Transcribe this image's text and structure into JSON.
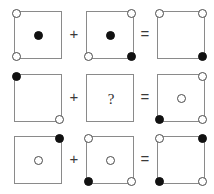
{
  "puzzle": {
    "title": "visual analogy dot puzzle",
    "operators": {
      "plus": "+",
      "equals": "=",
      "unknown": "?"
    },
    "colors": {
      "filled": "#111111",
      "open_fill": "#ffffff",
      "open_stroke": "#4a4a4a",
      "box_border": "#8a8a8a",
      "background": "#ffffff"
    },
    "slot_names": [
      "top-left",
      "top-right",
      "center",
      "bottom-left",
      "bottom-right"
    ],
    "rows": [
      {
        "index": 1,
        "operands": [
          {
            "name": "row1-operand-a",
            "dots": [
              {
                "slot": "top-left",
                "style": "open"
              },
              {
                "slot": "center",
                "style": "filled"
              },
              {
                "slot": "bottom-left",
                "style": "open"
              }
            ]
          },
          {
            "name": "row1-operand-b",
            "dots": [
              {
                "slot": "top-right",
                "style": "open"
              },
              {
                "slot": "center",
                "style": "filled"
              },
              {
                "slot": "bottom-left",
                "style": "open"
              },
              {
                "slot": "bottom-right",
                "style": "filled"
              }
            ]
          }
        ],
        "result": {
          "name": "row1-result",
          "dots": [
            {
              "slot": "top-left",
              "style": "open"
            },
            {
              "slot": "top-right",
              "style": "open"
            },
            {
              "slot": "bottom-right",
              "style": "filled"
            }
          ]
        }
      },
      {
        "index": 2,
        "operands": [
          {
            "name": "row2-operand-a",
            "dots": [
              {
                "slot": "top-left",
                "style": "filled"
              },
              {
                "slot": "bottom-right",
                "style": "open"
              }
            ]
          },
          {
            "name": "row2-operand-b-unknown",
            "unknown": true,
            "label": "?",
            "dots": []
          }
        ],
        "result": {
          "name": "row2-result",
          "dots": [
            {
              "slot": "top-right",
              "style": "open"
            },
            {
              "slot": "center",
              "style": "open"
            },
            {
              "slot": "bottom-left",
              "style": "filled"
            },
            {
              "slot": "bottom-right",
              "style": "open"
            }
          ]
        }
      },
      {
        "index": 3,
        "operands": [
          {
            "name": "row3-operand-a",
            "dots": [
              {
                "slot": "top-right",
                "style": "filled"
              },
              {
                "slot": "center",
                "style": "open"
              }
            ]
          },
          {
            "name": "row3-operand-b",
            "dots": [
              {
                "slot": "top-left",
                "style": "open"
              },
              {
                "slot": "center",
                "style": "open"
              },
              {
                "slot": "bottom-left",
                "style": "filled"
              },
              {
                "slot": "bottom-right",
                "style": "open"
              }
            ]
          }
        ],
        "result": {
          "name": "row3-result",
          "dots": [
            {
              "slot": "top-left",
              "style": "open"
            },
            {
              "slot": "top-right",
              "style": "filled"
            },
            {
              "slot": "bottom-left",
              "style": "filled"
            },
            {
              "slot": "bottom-right",
              "style": "open"
            }
          ]
        }
      }
    ]
  }
}
